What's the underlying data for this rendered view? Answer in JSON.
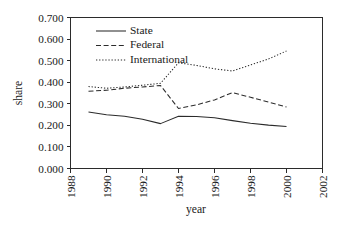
{
  "chart_data": {
    "type": "line",
    "title": "",
    "xlabel": "year",
    "ylabel": "share",
    "xlim": [
      1988,
      2002
    ],
    "ylim": [
      0.0,
      0.7
    ],
    "grid": false,
    "legend_position": "top-left-inside",
    "x": [
      1989,
      1990,
      1991,
      1992,
      1993,
      1994,
      1995,
      1996,
      1997,
      1998,
      1999,
      2000
    ],
    "xticks": [
      1988,
      1990,
      1992,
      1994,
      1996,
      1998,
      2000,
      2002
    ],
    "xticklabels": [
      "1988",
      "1990",
      "1992",
      "1994",
      "1996",
      "1998",
      "2000",
      "2002"
    ],
    "yticks": [
      0.0,
      0.1,
      0.2,
      0.3,
      0.4,
      0.5,
      0.6,
      0.7
    ],
    "yticklabels": [
      "0.000",
      "0.100",
      "0.200",
      "0.300",
      "0.400",
      "0.500",
      "0.600",
      "0.700"
    ],
    "series": [
      {
        "name": "State",
        "style": "solid",
        "color": "#2b2b2b",
        "values": [
          0.262,
          0.249,
          0.242,
          0.228,
          0.208,
          0.242,
          0.241,
          0.235,
          0.222,
          0.21,
          0.201,
          0.195
        ]
      },
      {
        "name": "Federal",
        "style": "dashed",
        "color": "#2b2b2b",
        "values": [
          0.358,
          0.363,
          0.372,
          0.378,
          0.385,
          0.278,
          0.295,
          0.318,
          0.352,
          0.33,
          0.308,
          0.285
        ]
      },
      {
        "name": "International",
        "style": "dotted",
        "color": "#2b2b2b",
        "values": [
          0.38,
          0.372,
          0.378,
          0.386,
          0.395,
          0.49,
          0.478,
          0.462,
          0.452,
          0.48,
          0.508,
          0.545
        ]
      }
    ]
  },
  "legend": {
    "entries": [
      {
        "label": "State",
        "style": "solid"
      },
      {
        "label": "Federal",
        "style": "dashed"
      },
      {
        "label": "International",
        "style": "dotted"
      }
    ]
  }
}
